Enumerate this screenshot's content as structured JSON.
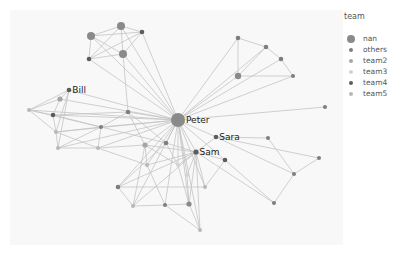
{
  "chart_data": {
    "type": "network",
    "title": "",
    "legend": {
      "title": "team",
      "position": "right",
      "entries": [
        {
          "name": "nan",
          "color": "#8a8a8a",
          "size": 8
        },
        {
          "name": "others",
          "color": "#7e7e7e",
          "size": 4
        },
        {
          "name": "team2",
          "color": "#a6a6a6",
          "size": 4
        },
        {
          "name": "team3",
          "color": "#d2d2d2",
          "size": 4
        },
        {
          "name": "team4",
          "color": "#5c5c5c",
          "size": 4
        },
        {
          "name": "team5",
          "color": "#b8b8b8",
          "size": 4
        }
      ]
    },
    "plot_area": {
      "x": 10,
      "y": 10,
      "width": 333,
      "height": 235,
      "background": "#f8f8f8"
    },
    "edge_color": "#c4c4c4",
    "labels": [
      {
        "text": "Peter",
        "node": 0
      },
      {
        "text": "Bill",
        "node": 10
      },
      {
        "text": "Sara",
        "node": 30
      },
      {
        "text": "Sam",
        "node": 31
      }
    ],
    "nodes": [
      {
        "id": 0,
        "x": 178,
        "y": 120,
        "r": 7,
        "team": "nan"
      },
      {
        "id": 1,
        "x": 121,
        "y": 26,
        "r": 4,
        "team": "nan"
      },
      {
        "id": 2,
        "x": 142,
        "y": 32,
        "r": 2.3,
        "team": "team4"
      },
      {
        "id": 3,
        "x": 91,
        "y": 36,
        "r": 4,
        "team": "nan"
      },
      {
        "id": 4,
        "x": 123,
        "y": 54,
        "r": 4,
        "team": "nan"
      },
      {
        "id": 5,
        "x": 89,
        "y": 59,
        "r": 2.3,
        "team": "team4"
      },
      {
        "id": 6,
        "x": 238,
        "y": 38,
        "r": 2.3,
        "team": "others"
      },
      {
        "id": 7,
        "x": 266,
        "y": 47,
        "r": 2.3,
        "team": "others"
      },
      {
        "id": 8,
        "x": 281,
        "y": 59,
        "r": 2.3,
        "team": "others"
      },
      {
        "id": 9,
        "x": 238,
        "y": 76,
        "r": 3.2,
        "team": "nan"
      },
      {
        "id": 10,
        "x": 69,
        "y": 90,
        "r": 2.3,
        "team": "team4"
      },
      {
        "id": 11,
        "x": 60,
        "y": 99,
        "r": 2.6,
        "team": "team2"
      },
      {
        "id": 12,
        "x": 29,
        "y": 110,
        "r": 2,
        "team": "team5"
      },
      {
        "id": 13,
        "x": 53,
        "y": 115,
        "r": 2.3,
        "team": "team4"
      },
      {
        "id": 14,
        "x": 56,
        "y": 132,
        "r": 2,
        "team": "team5"
      },
      {
        "id": 15,
        "x": 58,
        "y": 148,
        "r": 2,
        "team": "team5"
      },
      {
        "id": 16,
        "x": 101,
        "y": 127,
        "r": 2,
        "team": "others"
      },
      {
        "id": 17,
        "x": 98,
        "y": 148,
        "r": 2,
        "team": "team5"
      },
      {
        "id": 18,
        "x": 128,
        "y": 112,
        "r": 2.3,
        "team": "others"
      },
      {
        "id": 19,
        "x": 145,
        "y": 145,
        "r": 2.6,
        "team": "team2"
      },
      {
        "id": 20,
        "x": 166,
        "y": 143,
        "r": 2.3,
        "team": "others"
      },
      {
        "id": 21,
        "x": 147,
        "y": 165,
        "r": 2,
        "team": "team5"
      },
      {
        "id": 22,
        "x": 178,
        "y": 165,
        "r": 2,
        "team": "team3"
      },
      {
        "id": 23,
        "x": 187,
        "y": 175,
        "r": 2,
        "team": "team3"
      },
      {
        "id": 24,
        "x": 118,
        "y": 187,
        "r": 2.3,
        "team": "others"
      },
      {
        "id": 25,
        "x": 205,
        "y": 187,
        "r": 2,
        "team": "team5"
      },
      {
        "id": 26,
        "x": 133,
        "y": 206,
        "r": 2,
        "team": "team5"
      },
      {
        "id": 27,
        "x": 165,
        "y": 205,
        "r": 2,
        "team": "others"
      },
      {
        "id": 28,
        "x": 189,
        "y": 204,
        "r": 2.6,
        "team": "nan"
      },
      {
        "id": 29,
        "x": 200,
        "y": 230,
        "r": 2,
        "team": "team5"
      },
      {
        "id": 30,
        "x": 216,
        "y": 137,
        "r": 2.3,
        "team": "team4"
      },
      {
        "id": 31,
        "x": 196,
        "y": 152,
        "r": 2.6,
        "team": "team4"
      },
      {
        "id": 32,
        "x": 225,
        "y": 160,
        "r": 2.3,
        "team": "team4"
      },
      {
        "id": 33,
        "x": 268,
        "y": 138,
        "r": 2,
        "team": "others"
      },
      {
        "id": 34,
        "x": 319,
        "y": 158,
        "r": 2,
        "team": "others"
      },
      {
        "id": 35,
        "x": 294,
        "y": 174,
        "r": 2,
        "team": "others"
      },
      {
        "id": 36,
        "x": 274,
        "y": 203,
        "r": 2,
        "team": "others"
      },
      {
        "id": 37,
        "x": 325,
        "y": 107,
        "r": 2,
        "team": "others"
      },
      {
        "id": 38,
        "x": 293,
        "y": 76,
        "r": 2,
        "team": "others"
      }
    ],
    "edges": [
      [
        1,
        2
      ],
      [
        1,
        3
      ],
      [
        1,
        4
      ],
      [
        1,
        5
      ],
      [
        2,
        3
      ],
      [
        2,
        4
      ],
      [
        2,
        5
      ],
      [
        3,
        4
      ],
      [
        3,
        5
      ],
      [
        4,
        5
      ],
      [
        0,
        1
      ],
      [
        0,
        2
      ],
      [
        0,
        3
      ],
      [
        0,
        4
      ],
      [
        0,
        5
      ],
      [
        4,
        18
      ],
      [
        6,
        7
      ],
      [
        7,
        8
      ],
      [
        8,
        38
      ],
      [
        6,
        9
      ],
      [
        9,
        38
      ],
      [
        7,
        9
      ],
      [
        6,
        0
      ],
      [
        7,
        0
      ],
      [
        8,
        0
      ],
      [
        9,
        0
      ],
      [
        38,
        0
      ],
      [
        37,
        0
      ],
      [
        0,
        10
      ],
      [
        0,
        11
      ],
      [
        0,
        12
      ],
      [
        0,
        13
      ],
      [
        0,
        14
      ],
      [
        0,
        15
      ],
      [
        0,
        16
      ],
      [
        0,
        17
      ],
      [
        0,
        18
      ],
      [
        0,
        19
      ],
      [
        0,
        20
      ],
      [
        0,
        21
      ],
      [
        0,
        22
      ],
      [
        0,
        23
      ],
      [
        0,
        24
      ],
      [
        0,
        25
      ],
      [
        0,
        26
      ],
      [
        0,
        27
      ],
      [
        0,
        28
      ],
      [
        0,
        29
      ],
      [
        0,
        30
      ],
      [
        0,
        31
      ],
      [
        0,
        32
      ],
      [
        10,
        11
      ],
      [
        10,
        12
      ],
      [
        10,
        14
      ],
      [
        10,
        15
      ],
      [
        11,
        12
      ],
      [
        11,
        13
      ],
      [
        12,
        13
      ],
      [
        12,
        14
      ],
      [
        13,
        14
      ],
      [
        14,
        15
      ],
      [
        12,
        16
      ],
      [
        13,
        16
      ],
      [
        13,
        18
      ],
      [
        14,
        16
      ],
      [
        14,
        17
      ],
      [
        15,
        17
      ],
      [
        15,
        16
      ],
      [
        16,
        18
      ],
      [
        16,
        17
      ],
      [
        17,
        19
      ],
      [
        18,
        19
      ],
      [
        18,
        20
      ],
      [
        16,
        20
      ],
      [
        17,
        21
      ],
      [
        19,
        21
      ],
      [
        19,
        22
      ],
      [
        20,
        22
      ],
      [
        20,
        24
      ],
      [
        19,
        26
      ],
      [
        21,
        27
      ],
      [
        22,
        28
      ],
      [
        23,
        28
      ],
      [
        24,
        25
      ],
      [
        24,
        31
      ],
      [
        24,
        26
      ],
      [
        26,
        27
      ],
      [
        27,
        28
      ],
      [
        27,
        29
      ],
      [
        28,
        29
      ],
      [
        28,
        31
      ],
      [
        25,
        31
      ],
      [
        25,
        32
      ],
      [
        29,
        31
      ],
      [
        22,
        31
      ],
      [
        23,
        31
      ],
      [
        31,
        32
      ],
      [
        30,
        31
      ],
      [
        30,
        33
      ],
      [
        30,
        34
      ],
      [
        30,
        35
      ],
      [
        31,
        36
      ],
      [
        33,
        35
      ],
      [
        34,
        35
      ],
      [
        35,
        36
      ],
      [
        32,
        36
      ],
      [
        26,
        31
      ],
      [
        21,
        31
      ],
      [
        19,
        31
      ],
      [
        20,
        31
      ]
    ]
  }
}
